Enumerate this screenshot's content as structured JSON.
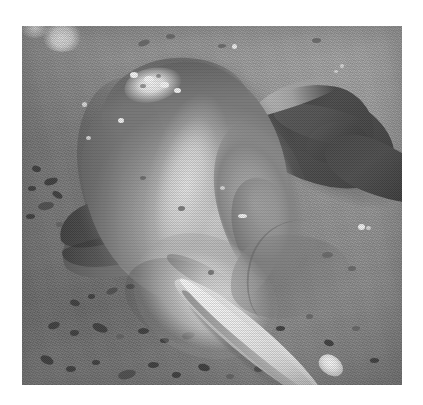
{
  "page": {
    "kind": "scanned-photograph",
    "background_color": "#ffffff",
    "width": 423,
    "height": 405
  },
  "photo": {
    "name": "river-dolphin-carcass-photo",
    "rendering": "grayscale halftone print scan",
    "frame": {
      "left": 22,
      "top": 26,
      "width": 380,
      "height": 359
    },
    "caption": "",
    "alt_text": "Grayscale photograph of a dead river dolphin lying on wet muddy ground",
    "subject": {
      "name": "river-dolphin",
      "common_name": "Ganges river dolphin",
      "pose": "lying on side, beak pointing to lower right, tail to upper right",
      "parts": [
        {
          "name": "torso",
          "tone": "#b1aea8"
        },
        {
          "name": "dorsal-wound-patch",
          "tone": "#f2f0ec"
        },
        {
          "name": "tail-fluke",
          "tone": "#434340"
        },
        {
          "name": "pectoral-fin",
          "tone": "#6e6e67"
        },
        {
          "name": "belly",
          "tone": "#e2dfda"
        },
        {
          "name": "rostrum-beak",
          "tone": "#f1efeb"
        },
        {
          "name": "beak-tip",
          "tone": "#fdfdfc"
        }
      ]
    },
    "background": {
      "name": "muddy-shore-ground",
      "tone": "#949491",
      "features": [
        "dark pebbles",
        "scattered debris",
        "light wet patches",
        "print grain"
      ]
    },
    "palette": {
      "paper_white": "#ffffff",
      "ground_mid": "#949491",
      "ground_light": "#a6a6a6",
      "ground_dark": "#5c5c59",
      "body_light": "#d7d4cf",
      "body_mid": "#a9a6a0",
      "fin_dark": "#3f3f3d",
      "highlight_white": "#fbfaf8"
    }
  }
}
